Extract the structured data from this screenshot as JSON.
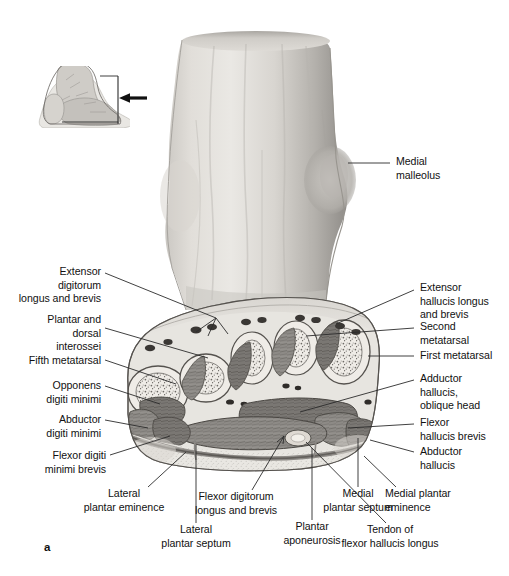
{
  "figure": {
    "panel_label": "a",
    "inset": {
      "name": "lateral foot orientation diagram",
      "arrow": "left-pointing-arrow"
    },
    "specimen": "transverse section through the forefoot / distal tarsus, viewed from distal"
  },
  "labels_left": [
    {
      "id": "extensor-digitorum-longus-and-brevis",
      "text": "Extensor\ndigitorum\nlongus and brevis"
    },
    {
      "id": "plantar-and-dorsal-interossei",
      "text": "Plantar and\ndorsal\ninterossei"
    },
    {
      "id": "fifth-metatarsal",
      "text": "Fifth metatarsal"
    },
    {
      "id": "opponens-digiti-minimi",
      "text": "Opponens\ndigiti minimi"
    },
    {
      "id": "abductor-digiti-minimi",
      "text": "Abductor\ndigiti minimi"
    },
    {
      "id": "flexor-digiti-minimi-brevis",
      "text": "Flexor digiti\nminimi brevis"
    },
    {
      "id": "lateral-plantar-eminence",
      "text": "Lateral\nplantar eminence"
    }
  ],
  "labels_right": [
    {
      "id": "medial-malleolus",
      "text": "Medial\nmalleolus"
    },
    {
      "id": "extensor-hallucis-longus-and-brevis",
      "text": "Extensor\nhallucis longus\nand brevis"
    },
    {
      "id": "second-metatarsal",
      "text": "Second\nmetatarsal"
    },
    {
      "id": "first-metatarsal",
      "text": "First metatarsal"
    },
    {
      "id": "adductor-hallucis-oblique-head",
      "text": "Adductor\nhallucis,\noblique head"
    },
    {
      "id": "flexor-hallucis-brevis",
      "text": "Flexor\nhallucis brevis"
    },
    {
      "id": "abductor-hallucis",
      "text": "Abductor\nhallucis"
    },
    {
      "id": "medial-plantar-eminence",
      "text": "Medial plantar\neminence"
    }
  ],
  "labels_bottom": [
    {
      "id": "lateral-plantar-septum",
      "text": "Lateral\nplantar septum"
    },
    {
      "id": "flexor-digitorum-longus-and-brevis",
      "text": "Flexor digitorum\nlongus and brevis"
    },
    {
      "id": "plantar-aponeurosis",
      "text": "Plantar\naponeurosis"
    },
    {
      "id": "medial-plantar-septum",
      "text": "Medial\nplantar septum"
    },
    {
      "id": "tendon-of-flexor-hallucis-longus",
      "text": "Tendon of\nflexor hallucis longus"
    }
  ],
  "colors": {
    "background": "#ffffff",
    "text": "#111111",
    "leader_line": "#2b2b2b",
    "skin_light": "#e4e2de",
    "skin_mid": "#bdbab5",
    "skin_dark": "#8e8b87",
    "bone_fill": "#efece7",
    "muscle_dark": "#6f6c68",
    "muscle_mid": "#9a9793",
    "fat_pad": "#e8e6e1",
    "arrow": "#111111"
  }
}
